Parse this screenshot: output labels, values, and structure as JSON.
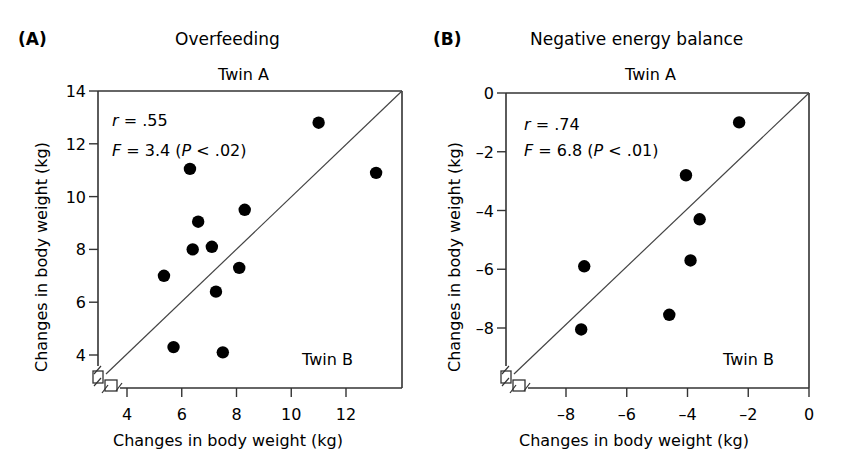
{
  "chart_data": [
    {
      "type": "scatter",
      "panel_label": "(A)",
      "title": "Overfeeding",
      "top_label": "Twin A",
      "corner_label": "Twin B",
      "xlabel": "Changes in body weight (kg)",
      "ylabel": "Changes in body weight (kg)",
      "xlim": [
        3,
        14
      ],
      "ylim": [
        3,
        14
      ],
      "xticks": [
        4,
        6,
        8,
        10,
        12
      ],
      "yticks": [
        4,
        6,
        8,
        10,
        12,
        14
      ],
      "identity_line": true,
      "axis_break": true,
      "stats": {
        "r_label": "r",
        "r_text": " = .55",
        "f_label": "F",
        "f_text": " = 3.4 (",
        "p_label": "P",
        "p_text": " < .02)"
      },
      "points": [
        {
          "x": 11.0,
          "y": 12.8
        },
        {
          "x": 13.1,
          "y": 10.9
        },
        {
          "x": 6.3,
          "y": 11.05
        },
        {
          "x": 6.6,
          "y": 9.05
        },
        {
          "x": 8.3,
          "y": 9.5
        },
        {
          "x": 6.4,
          "y": 8.0
        },
        {
          "x": 7.1,
          "y": 8.1
        },
        {
          "x": 5.35,
          "y": 7.0
        },
        {
          "x": 8.1,
          "y": 7.3
        },
        {
          "x": 7.25,
          "y": 6.4
        },
        {
          "x": 5.7,
          "y": 4.3
        },
        {
          "x": 7.5,
          "y": 4.1
        }
      ]
    },
    {
      "type": "scatter",
      "panel_label": "(B)",
      "title": "Negative energy balance",
      "top_label": "Twin A",
      "corner_label": "Twin B",
      "xlabel": "Changes in body weight (kg)",
      "ylabel": "Changes in body weight (kg)",
      "xlim": [
        -10,
        0
      ],
      "ylim": [
        -10,
        0
      ],
      "xticks": [
        -8,
        -6,
        -4,
        -2,
        0
      ],
      "yticks": [
        -8,
        -6,
        -4,
        -2,
        0
      ],
      "identity_line": true,
      "axis_break": true,
      "stats": {
        "r_label": "r",
        "r_text": " = .74",
        "f_label": "F",
        "f_text": " = 6.8 (",
        "p_label": "P",
        "p_text": " < .01)"
      },
      "points": [
        {
          "x": -2.3,
          "y": -1.0
        },
        {
          "x": -4.05,
          "y": -2.8
        },
        {
          "x": -3.6,
          "y": -4.3
        },
        {
          "x": -3.9,
          "y": -5.7
        },
        {
          "x": -7.4,
          "y": -5.9
        },
        {
          "x": -4.6,
          "y": -7.55
        },
        {
          "x": -7.5,
          "y": -8.05
        }
      ]
    }
  ]
}
